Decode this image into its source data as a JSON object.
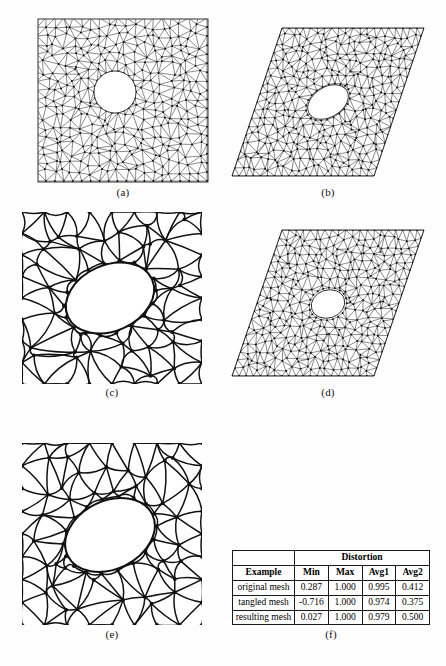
{
  "figure": {
    "panels": [
      {
        "id": "a",
        "caption": "(a)",
        "name": "original-mesh-square",
        "description": "fine triangular mesh in unit square with circular hole"
      },
      {
        "id": "b",
        "caption": "(b)",
        "name": "sheared-mesh-parallelogram",
        "description": "fine triangular mesh in sheared parallelogram with elliptical hole"
      },
      {
        "id": "c",
        "caption": "(c)",
        "name": "tangled-mesh-square",
        "description": "coarse tangled mesh with curved edges and large ellipse"
      },
      {
        "id": "d",
        "caption": "(d)",
        "name": "resulting-mesh-parallelogram",
        "description": "fine triangular mesh in sheared parallelogram with small hole"
      },
      {
        "id": "e",
        "caption": "(e)",
        "name": "resulting-mesh-square",
        "description": "coarse untangled mesh with curved edges and large ellipse"
      },
      {
        "id": "f",
        "caption": "(f)",
        "name": "distortion-table",
        "description": "distortion statistics table"
      }
    ]
  },
  "chart_data": {
    "type": "table",
    "title": "Distortion",
    "group_header": "Distortion",
    "row_header": "Example",
    "columns": [
      "Example",
      "Min",
      "Max",
      "Avg1",
      "Avg2"
    ],
    "value_columns": [
      "Min",
      "Max",
      "Avg1",
      "Avg2"
    ],
    "rows": [
      {
        "label": "original mesh",
        "values": [
          "0.287",
          "1.000",
          "0.995",
          "0.412"
        ]
      },
      {
        "label": "tangled mesh",
        "values": [
          "-0.716",
          "1.000",
          "0.974",
          "0.375"
        ]
      },
      {
        "label": "resulting mesh",
        "values": [
          "0.027",
          "1.000",
          "0.979",
          "0.500"
        ]
      }
    ]
  },
  "colors": {
    "ink": "#1a1a1a",
    "paper": "#fefefe",
    "mesh_line": "#222222"
  }
}
